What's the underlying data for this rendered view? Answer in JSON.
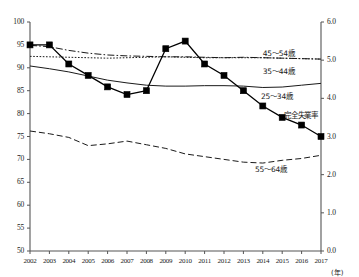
{
  "chart_data": {
    "type": "line",
    "title": "",
    "xlabel": "(年)",
    "ylabel_left": "",
    "ylabel_right": "",
    "x": [
      2002,
      2003,
      2004,
      2005,
      2006,
      2007,
      2008,
      2009,
      2010,
      2011,
      2012,
      2013,
      2014,
      2015,
      2016,
      2017
    ],
    "xtick_labels": [
      "2002",
      "2003",
      "2004",
      "2005",
      "2006",
      "2007",
      "2008",
      "2009",
      "2010",
      "2011",
      "2012",
      "2013",
      "2014",
      "2015",
      "2016",
      "2017"
    ],
    "ylim_left": [
      50,
      100
    ],
    "ytick_labels_left": [
      "50",
      "55",
      "60",
      "65",
      "70",
      "75",
      "80",
      "85",
      "90",
      "95",
      "100"
    ],
    "ytick_values_left": [
      50,
      55,
      60,
      65,
      70,
      75,
      80,
      85,
      90,
      95,
      100
    ],
    "ylim_right": [
      0.0,
      6.0
    ],
    "ytick_labels_right": [
      "0.0",
      "1.0",
      "2.0",
      "3.0",
      "4.0",
      "5.0",
      "6.0"
    ],
    "ytick_values_right": [
      0,
      1,
      2,
      3,
      4,
      5,
      6
    ],
    "grid": false,
    "legend_position": "inline-annotations",
    "series": [
      {
        "name": "45～54歳",
        "axis": "left",
        "style": "dash-dot",
        "marker": "none",
        "color": "#1a1a1a",
        "label_x": 2014.0,
        "label_y": 93.4,
        "values": [
          94.9,
          94.6,
          93.8,
          93.2,
          92.8,
          92.6,
          92.5,
          92.4,
          92.4,
          92.3,
          92.2,
          92.3,
          92.2,
          92.1,
          92.0,
          91.9
        ]
      },
      {
        "name": "35～44歳",
        "axis": "left",
        "style": "dotted",
        "marker": "none",
        "color": "#1a1a1a",
        "label_x": 2014.0,
        "label_y": 89.6,
        "values": [
          92.5,
          92.4,
          92.3,
          92.2,
          92.1,
          92.2,
          92.3,
          92.4,
          92.3,
          92.2,
          92.2,
          92.2,
          92.2,
          92.1,
          92.0,
          91.9
        ]
      },
      {
        "name": "25～34歳",
        "axis": "left",
        "style": "solid",
        "marker": "none",
        "color": "#1a1a1a",
        "label_x": 2013.9,
        "label_y": 84.0,
        "values": [
          90.4,
          89.8,
          89.1,
          88.2,
          87.3,
          86.7,
          86.2,
          86.0,
          86.0,
          86.1,
          86.1,
          86.0,
          85.7,
          85.8,
          86.2,
          86.6
        ]
      },
      {
        "name": "55～64歳",
        "axis": "left",
        "style": "dashed",
        "marker": "none",
        "color": "#1a1a1a",
        "label_x": 2013.6,
        "label_y": 68.2,
        "values": [
          76.2,
          75.6,
          74.8,
          73.0,
          73.4,
          74.0,
          73.2,
          72.4,
          71.2,
          70.6,
          70.0,
          69.4,
          69.2,
          69.8,
          70.2,
          70.9
        ]
      },
      {
        "name": "完全失業率",
        "axis": "right",
        "style": "solid-marker",
        "marker": "square",
        "color": "#000000",
        "label_x": 2015.1,
        "label_y": 80.0,
        "values": [
          5.4,
          5.4,
          4.9,
          4.6,
          4.3,
          4.1,
          4.2,
          5.3,
          5.5,
          4.9,
          4.6,
          4.2,
          3.8,
          3.5,
          3.3,
          3.0
        ]
      }
    ],
    "annotations": [
      {
        "text": "(年)",
        "x": 2018.2,
        "position": "below-axis-right"
      }
    ]
  },
  "axes": {
    "left_tick_text": [
      "100",
      "95",
      "90",
      "85",
      "80",
      "75",
      "70",
      "65",
      "60",
      "55",
      "50"
    ],
    "right_tick_text": [
      "6.0",
      "5.0",
      "4.0",
      "3.0",
      "2.0",
      "1.0",
      "0.0"
    ],
    "x_unit": "(年)"
  }
}
